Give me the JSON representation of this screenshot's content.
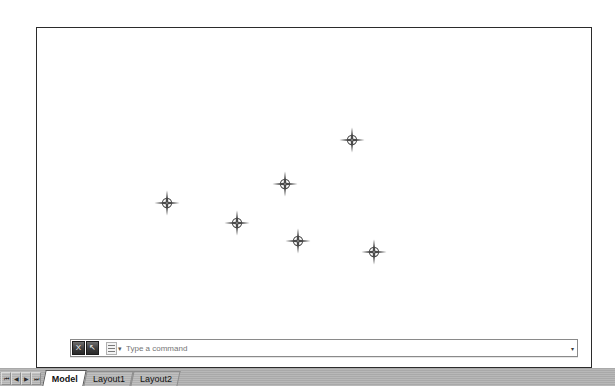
{
  "window": {
    "canvas_background": "#ffffff",
    "border_color": "#2b2b2b"
  },
  "command_bar": {
    "placeholder": "Type a command",
    "value": "",
    "close_label": "X",
    "search_label": "↖",
    "recent_icon": "recent-commands-icon",
    "dropdown_icon": "chevron-down-icon"
  },
  "status_bar": {
    "nav_buttons": [
      {
        "name": "first-layout-button",
        "glyph": "⏮"
      },
      {
        "name": "previous-layout-button",
        "glyph": "◀"
      },
      {
        "name": "next-layout-button",
        "glyph": "▶"
      },
      {
        "name": "last-layout-button",
        "glyph": "⏭"
      }
    ],
    "tabs": [
      {
        "label": "Model",
        "active": true
      },
      {
        "label": "Layout1",
        "active": false
      },
      {
        "label": "Layout2",
        "active": false
      }
    ]
  },
  "drawing": {
    "marker_style": "circle-cross-point",
    "marker_color": "#4a4a4a",
    "points": [
      {
        "id": "point-1",
        "x": 315,
        "y": 112
      },
      {
        "id": "point-2",
        "x": 248,
        "y": 156
      },
      {
        "id": "point-3",
        "x": 200,
        "y": 195
      },
      {
        "id": "point-4",
        "x": 261,
        "y": 213
      },
      {
        "id": "point-5",
        "x": 337,
        "y": 224
      },
      {
        "id": "point-6",
        "x": 130,
        "y": 175
      }
    ]
  },
  "chart_data": {
    "type": "scatter",
    "title": "",
    "xlabel": "",
    "ylabel": "",
    "series": [
      {
        "name": "points",
        "marker": "circle-cross",
        "x": [
          351,
          284,
          236,
          297,
          373
        ],
        "y": [
          139,
          183,
          222,
          240,
          251
        ]
      }
    ],
    "grid": false,
    "legend": "none"
  }
}
